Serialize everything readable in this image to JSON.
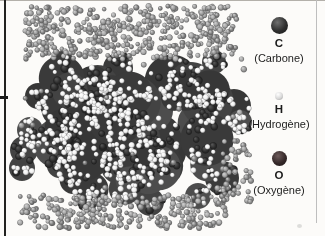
{
  "legend": {
    "items": [
      {
        "symbol": "C",
        "name": "(Carbone)",
        "color": "#2b2b2b"
      },
      {
        "symbol": "H",
        "name": "(Hydrogène)",
        "color": "#d9d9d9"
      },
      {
        "symbol": "O",
        "name": "(Oxygène)",
        "color": "#352a2b"
      }
    ]
  },
  "molecule": {
    "seed": 12,
    "solvent_shades": [
      "#767676",
      "#878787",
      "#969696",
      "#a6a6a6"
    ],
    "solvent_regions": [
      {
        "x": 24,
        "y": 6,
        "w": 214,
        "h": 53,
        "count": 430
      },
      {
        "x": 20,
        "y": 195,
        "w": 208,
        "h": 33,
        "count": 260
      },
      {
        "x": 222,
        "y": 140,
        "w": 30,
        "h": 62,
        "count": 48
      },
      {
        "x": 14,
        "y": 6,
        "w": 230,
        "h": 222,
        "count": 28
      }
    ],
    "core": {
      "x0": 50,
      "x1": 215,
      "y0": 78,
      "y1": 193,
      "blob_count": 55,
      "fill_shades": [
        "#3a3a3a",
        "#434343",
        "#4d4d4d",
        "#373737"
      ],
      "bumps": [
        [
          234,
          106,
          17
        ],
        [
          240,
          122,
          12
        ],
        [
          30,
          130,
          13
        ],
        [
          24,
          150,
          14
        ],
        [
          22,
          168,
          13
        ],
        [
          222,
          178,
          17
        ],
        [
          62,
          64,
          13
        ],
        [
          118,
          68,
          15
        ],
        [
          176,
          70,
          13
        ],
        [
          214,
          62,
          12
        ],
        [
          92,
          200,
          14
        ],
        [
          150,
          202,
          14
        ],
        [
          198,
          196,
          13
        ],
        [
          38,
          96,
          13
        ]
      ],
      "carbon_count": 200,
      "carbon_color": "#2d2d2d",
      "hydrogen_count": 560,
      "hydrogen_color": "#f1f1f1"
    }
  }
}
